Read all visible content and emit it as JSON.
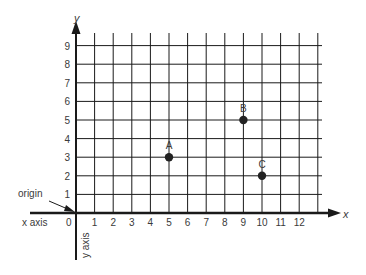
{
  "chart_data": {
    "type": "scatter",
    "title": "",
    "xlabel": "x",
    "ylabel": "y",
    "x_axis_name": "x axis",
    "y_axis_name": "y axis",
    "origin_label": "origin",
    "origin_tick": "0",
    "x_ticks": [
      "1",
      "2",
      "3",
      "4",
      "5",
      "6",
      "7",
      "8",
      "9",
      "10",
      "11",
      "12"
    ],
    "y_ticks": [
      "1",
      "2",
      "3",
      "4",
      "5",
      "6",
      "7",
      "8",
      "9"
    ],
    "xlim": [
      0,
      13
    ],
    "ylim": [
      0,
      9.6
    ],
    "grid": true,
    "points": [
      {
        "label": "A",
        "x": 5,
        "y": 3
      },
      {
        "label": "B",
        "x": 9,
        "y": 5
      },
      {
        "label": "C",
        "x": 10,
        "y": 2
      }
    ]
  },
  "colors": {
    "ink": "#1a1a1a",
    "text": "#3a3a3a",
    "background": "#ffffff"
  }
}
